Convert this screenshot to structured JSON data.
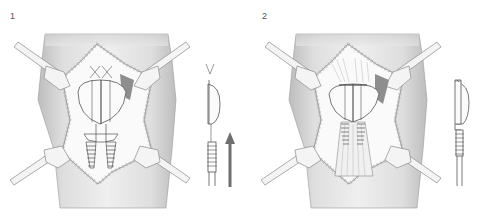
{
  "panels": [
    {
      "label": "1",
      "arrow": true
    },
    {
      "label": "2",
      "arrow": false
    }
  ],
  "colors": {
    "skin": "#e4e4e4",
    "skin_dark": "#c8c8c8",
    "line": "#6a6a6a",
    "retractor": "#f2f2f2",
    "shadow": "#9a9a9a",
    "arrow": "#6e6e6e"
  }
}
